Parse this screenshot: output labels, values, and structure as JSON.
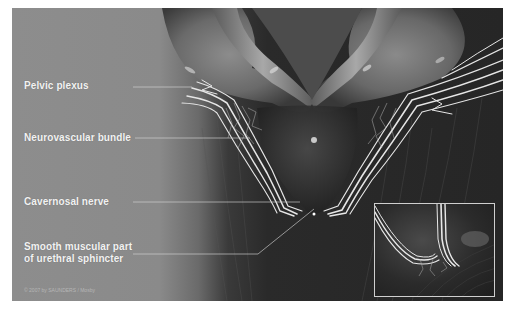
{
  "figure": {
    "type": "anatomical-illustration",
    "colors": {
      "label_panel": "#8a8a8a",
      "dark_background": "#262626",
      "label_text": "#f2f2f2",
      "leader_line": "#d8d8d8",
      "nerve": "#e6e6e6",
      "inset_border": "#cfcfcf"
    },
    "labels": [
      {
        "id": "pelvic-plexus",
        "text": "Pelvic plexus"
      },
      {
        "id": "neurovascular-bundle",
        "text": "Neurovascular bundle"
      },
      {
        "id": "cavernosal-nerve",
        "text": "Cavernosal nerve"
      },
      {
        "id": "sphincter",
        "line1": "Smooth muscular part",
        "line2": "of urethral sphincter"
      }
    ],
    "copyright": "© 2007 by SAUNDERS / Mosby",
    "inset": {
      "description": "Close-up of nerve fibers near urethral sphincter"
    }
  }
}
